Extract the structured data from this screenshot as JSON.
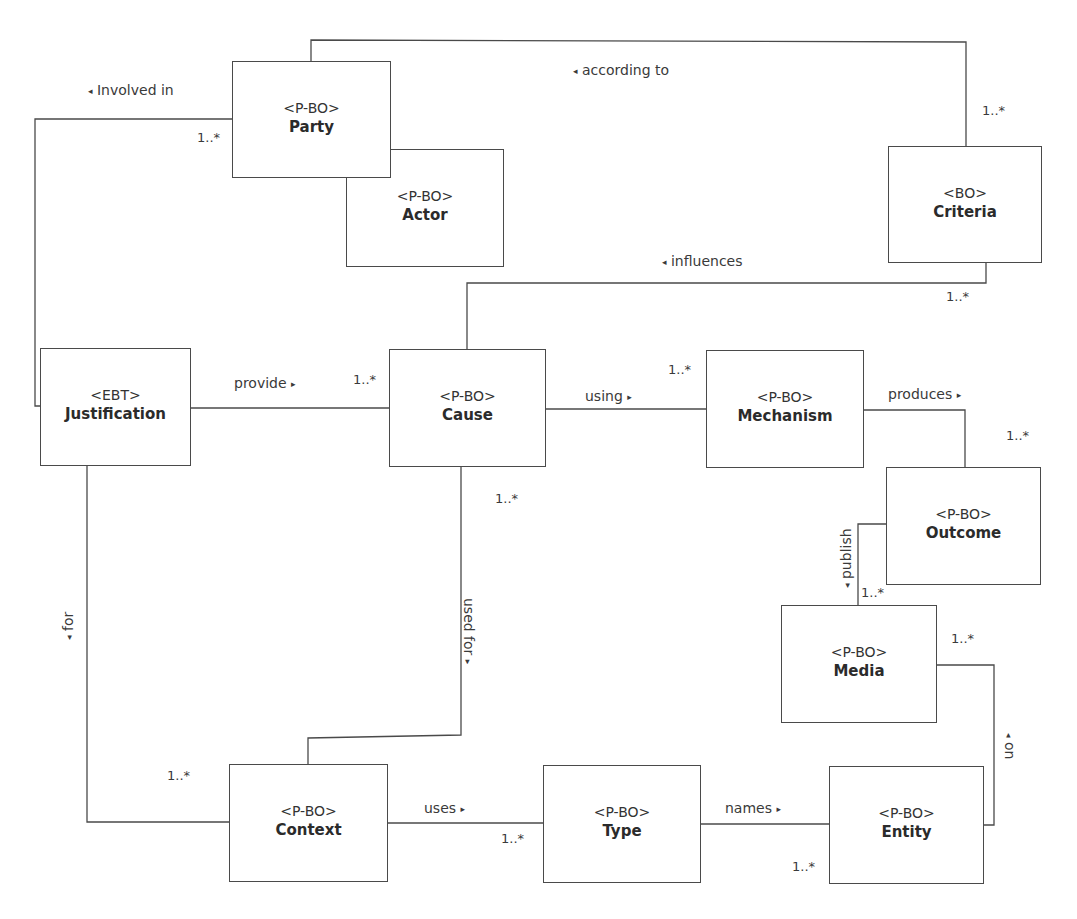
{
  "diagram": {
    "type": "UML class diagram",
    "classes": [
      {
        "id": "party",
        "stereotype": "<P-BO>",
        "name": "Party"
      },
      {
        "id": "actor",
        "stereotype": "<P-BO>",
        "name": "Actor"
      },
      {
        "id": "criteria",
        "stereotype": "<BO>",
        "name": "Criteria"
      },
      {
        "id": "justification",
        "stereotype": "<EBT>",
        "name": "Justification"
      },
      {
        "id": "cause",
        "stereotype": "<P-BO>",
        "name": "Cause"
      },
      {
        "id": "mechanism",
        "stereotype": "<P-BO>",
        "name": "Mechanism"
      },
      {
        "id": "outcome",
        "stereotype": "<P-BO>",
        "name": "Outcome"
      },
      {
        "id": "media",
        "stereotype": "<P-BO>",
        "name": "Media"
      },
      {
        "id": "context",
        "stereotype": "<P-BO>",
        "name": "Context"
      },
      {
        "id": "type",
        "stereotype": "<P-BO>",
        "name": "Type"
      },
      {
        "id": "entity",
        "stereotype": "<P-BO>",
        "name": "Entity"
      }
    ],
    "associations": [
      {
        "id": "involved_in",
        "label": "Involved in",
        "arrow": "◂",
        "from": "Justification",
        "to": "Party",
        "multiplicity": "1..*"
      },
      {
        "id": "according_to",
        "label": "according to",
        "arrow": "◂",
        "from": "Party",
        "to": "Criteria",
        "multiplicity": "1..*"
      },
      {
        "id": "influences",
        "label": "influences",
        "arrow": "◂",
        "from": "Cause",
        "to": "Criteria",
        "multiplicity": "1..*"
      },
      {
        "id": "provide",
        "label": "provide",
        "arrow": "▸",
        "from": "Justification",
        "to": "Cause",
        "multiplicity": "1..*"
      },
      {
        "id": "using",
        "label": "using",
        "arrow": "▸",
        "from": "Cause",
        "to": "Mechanism",
        "multiplicity": "1..*"
      },
      {
        "id": "produces",
        "label": "produces",
        "arrow": "▸",
        "from": "Mechanism",
        "to": "Outcome",
        "multiplicity": "1..*"
      },
      {
        "id": "publish",
        "label": "publish",
        "arrow": "◂",
        "from": "Outcome",
        "to": "Media",
        "multiplicity": "1..*"
      },
      {
        "id": "on",
        "label": "on",
        "arrow": "◂",
        "from": "Media",
        "to": "Entity",
        "multiplicity": "1..*"
      },
      {
        "id": "used_for",
        "label": "used for",
        "arrow": "▸",
        "from": "Cause",
        "to": "Context",
        "multiplicity": "1..*"
      },
      {
        "id": "for",
        "label": "for",
        "arrow": "◂",
        "from": "Justification",
        "to": "Context",
        "multiplicity": "1..*"
      },
      {
        "id": "uses",
        "label": "uses",
        "arrow": "▸",
        "from": "Context",
        "to": "Type",
        "multiplicity": "1..*"
      },
      {
        "id": "names",
        "label": "names",
        "arrow": "▸",
        "from": "Type",
        "to": "Entity",
        "multiplicity": "1..*"
      }
    ]
  },
  "boxes": {
    "party": {
      "stereotype": "<P-BO>",
      "name": "Party"
    },
    "actor": {
      "stereotype": "<P-BO>",
      "name": "Actor"
    },
    "criteria": {
      "stereotype": "<BO>",
      "name": "Criteria"
    },
    "justification": {
      "stereotype": "<EBT>",
      "name": "Justification"
    },
    "cause": {
      "stereotype": "<P-BO>",
      "name": "Cause"
    },
    "mechanism": {
      "stereotype": "<P-BO>",
      "name": "Mechanism"
    },
    "outcome": {
      "stereotype": "<P-BO>",
      "name": "Outcome"
    },
    "media": {
      "stereotype": "<P-BO>",
      "name": "Media"
    },
    "context": {
      "stereotype": "<P-BO>",
      "name": "Context"
    },
    "type": {
      "stereotype": "<P-BO>",
      "name": "Type"
    },
    "entity": {
      "stereotype": "<P-BO>",
      "name": "Entity"
    }
  },
  "labels": {
    "involved_in": "Involved in",
    "according_to": "according to",
    "influences": "influences",
    "provide": "provide",
    "using": "using",
    "produces": "produces",
    "publish": "publish",
    "on": "on",
    "used_for": "used for",
    "for": "for",
    "uses": "uses",
    "names": "names"
  },
  "arrows": {
    "left": "◂",
    "right": "▸"
  },
  "multiplicity": "1..*"
}
